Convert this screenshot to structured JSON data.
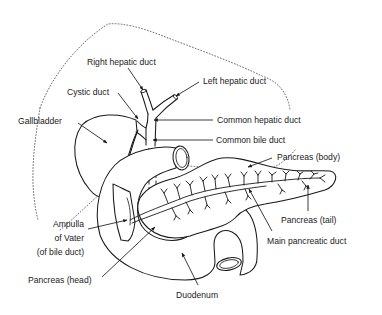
{
  "figure": {
    "labels": {
      "right_hepatic_duct": "Right hepatic duct",
      "left_hepatic_duct": "Left hepatic duct",
      "cystic_duct": "Cystic duct",
      "gallbladder": "Gallbladder",
      "common_hepatic_duct": "Common hepatic duct",
      "common_bile_duct": "Common bile duct",
      "pancreas_body": "Pancreas (body)",
      "pancreas_tail": "Pancreas (tail)",
      "main_pancreatic_duct": "Main pancreatic duct",
      "ampulla_line1": "Ampulla",
      "ampulla_line2": "of Vater",
      "ampulla_line3": "(of bile duct)",
      "pancreas_head": "Pancreas (head)",
      "duodenum": "Duodenum"
    },
    "colors": {
      "line": "#1a1a1a",
      "background": "#ffffff",
      "text": "#222222"
    }
  }
}
